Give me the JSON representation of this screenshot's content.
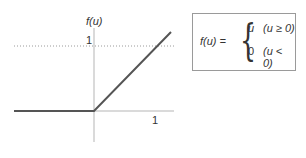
{
  "graph": {
    "y_axis_label": "f(u)",
    "y_tick_label": "1",
    "x_tick_label": "1",
    "line_color": "#555555",
    "axis_color": "#b0b0b0",
    "dotted_color": "#9a9a9a"
  },
  "formula": {
    "lhs": "f(u) =",
    "cases": [
      {
        "value": "u",
        "condition": "(u ≥ 0)"
      },
      {
        "value": "0",
        "condition": "(u < 0)"
      }
    ]
  }
}
